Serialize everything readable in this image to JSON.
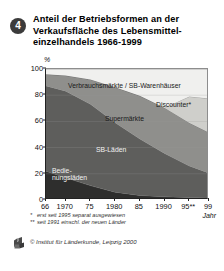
{
  "badge": "4",
  "title_lines": [
    "Anteil der Betriebsformen an der",
    "Verkaufsfläche des Lebensmittel-",
    "einzelhandels 1966-1999"
  ],
  "axis": {
    "y_unit": "%",
    "x_label": "Jahr"
  },
  "footnotes": [
    {
      "marker": "*",
      "text": "erst seit 1995 separat ausgewiesen"
    },
    {
      "marker": "**",
      "text": "seit 1991 einschl. der neuen Länder"
    }
  ],
  "source": {
    "text": "© Institut für Länderkunde, Leipzig 2000",
    "logo": "ifl-logo-icon"
  },
  "colors": {
    "verbrauchsmaerkte": "#f0f0ee",
    "discounter": "#cfcfcb",
    "supermaerkte": "#8f8f8c",
    "sb_laeden": "#5e5e5c",
    "bedienungsladen": "#2e2e2d",
    "axis": "#222222",
    "grid": "#9a9a9a",
    "badge": "#3b3b3b"
  },
  "chart_data": {
    "type": "area",
    "xlabel": "Jahr",
    "ylabel": "%",
    "ylim": [
      0,
      100
    ],
    "xlim": [
      1966,
      1999
    ],
    "grid": true,
    "stacked": true,
    "legend": "in-chart-labels",
    "x": [
      1966,
      1970,
      1975,
      1980,
      1985,
      1990,
      1995,
      1999
    ],
    "xtick_labels": [
      "66",
      "1970",
      "75",
      "1980",
      "85",
      "1990",
      "95**",
      "99"
    ],
    "ytick_labels": [
      "0",
      "20",
      "40",
      "60",
      "80",
      "100"
    ],
    "series": [
      {
        "name": "Bedienungsläden",
        "label_lines": [
          "Bedie-",
          "nungsläden"
        ],
        "color": "#2e2e2d",
        "values": [
          22,
          17,
          11,
          6,
          3.5,
          2.5,
          2,
          1.5
        ]
      },
      {
        "name": "SB-Läden",
        "label_lines": [
          "SB-Läden"
        ],
        "color": "#5e5e5c",
        "values": [
          65,
          66,
          62,
          53,
          43,
          33,
          24,
          19
        ]
      },
      {
        "name": "Supermärkte",
        "label_lines": [
          "Supermärkte"
        ],
        "color": "#8f8f8c",
        "values": [
          9,
          12,
          19,
          27,
          33,
          35,
          33,
          31
        ]
      },
      {
        "name": "Discounter*",
        "label_lines": [
          "Discounter*"
        ],
        "color": "#cfcfcb",
        "values": [
          0,
          0,
          0,
          0,
          0,
          0,
          20,
          26
        ]
      },
      {
        "name": "Verbrauchsmärkte / SB-Warenhäuser",
        "label_lines": [
          "Verbrauchsmärkte / SB-Warenhäuser"
        ],
        "color": "#f0f0ee",
        "values": [
          4,
          5,
          8,
          14,
          20.5,
          29.5,
          21,
          22.5
        ]
      }
    ]
  }
}
